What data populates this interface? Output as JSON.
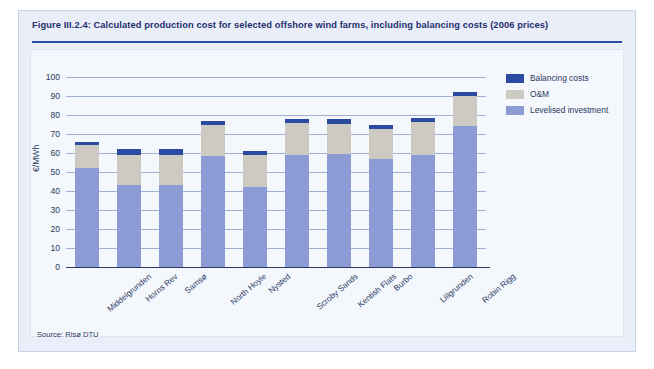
{
  "figure": {
    "title": "Figure III.2.4: Calculated production cost for selected offshore wind farms, including balancing costs (2006 prices)",
    "source": "Source: Risø DTU"
  },
  "colors": {
    "balancing": "#2b4ba0",
    "om": "#cdcac1",
    "investment": "#8c9bd4",
    "panel": "#e9eef8",
    "rule": "#2b4ba0",
    "grid": "#9fb0d2",
    "text": "#2b3a63"
  },
  "legend": {
    "position": "top-right",
    "items": [
      {
        "label": "Balancing costs",
        "color": "#2b4ba0"
      },
      {
        "label": "O&M",
        "color": "#cdcac1"
      },
      {
        "label": "Levelised investment",
        "color": "#8c9bd4"
      }
    ]
  },
  "chart_data": {
    "type": "bar",
    "stacked": true,
    "title": "Calculated production cost for selected offshore wind farms, including balancing costs (2006 prices)",
    "xlabel": "",
    "ylabel": "€/MWh",
    "ylim": [
      0,
      100
    ],
    "yticks": [
      0,
      10,
      20,
      30,
      40,
      50,
      60,
      70,
      80,
      90,
      100
    ],
    "ytick_labels": [
      "0",
      "10",
      "20",
      "30",
      "40",
      "50",
      "60",
      "70",
      "80",
      "90",
      "100"
    ],
    "grid": true,
    "categories": [
      "Middelgrunden",
      "Horns Rev",
      "Samsø",
      "North Hoyle",
      "Nysted",
      "Scroby Sands",
      "Kentish Flats",
      "Burbo",
      "Lillgrunden",
      "Robin Rigg"
    ],
    "series": [
      {
        "name": "Levelised investment",
        "color": "#8c9bd4",
        "values": [
          52,
          43,
          43,
          58.5,
          42,
          59,
          59.5,
          57,
          59,
          74
        ]
      },
      {
        "name": "O&M",
        "color": "#cdcac1",
        "values": [
          12,
          16,
          16,
          16.5,
          17,
          17,
          16,
          15.5,
          17.5,
          16
        ]
      },
      {
        "name": "Balancing costs",
        "color": "#2b4ba0",
        "values": [
          2,
          3,
          3,
          2,
          2,
          2,
          2.5,
          2,
          2,
          2
        ]
      }
    ],
    "totals": [
      66,
      62,
      62,
      77,
      61,
      78,
      78,
      74.5,
      78.5,
      92
    ]
  }
}
